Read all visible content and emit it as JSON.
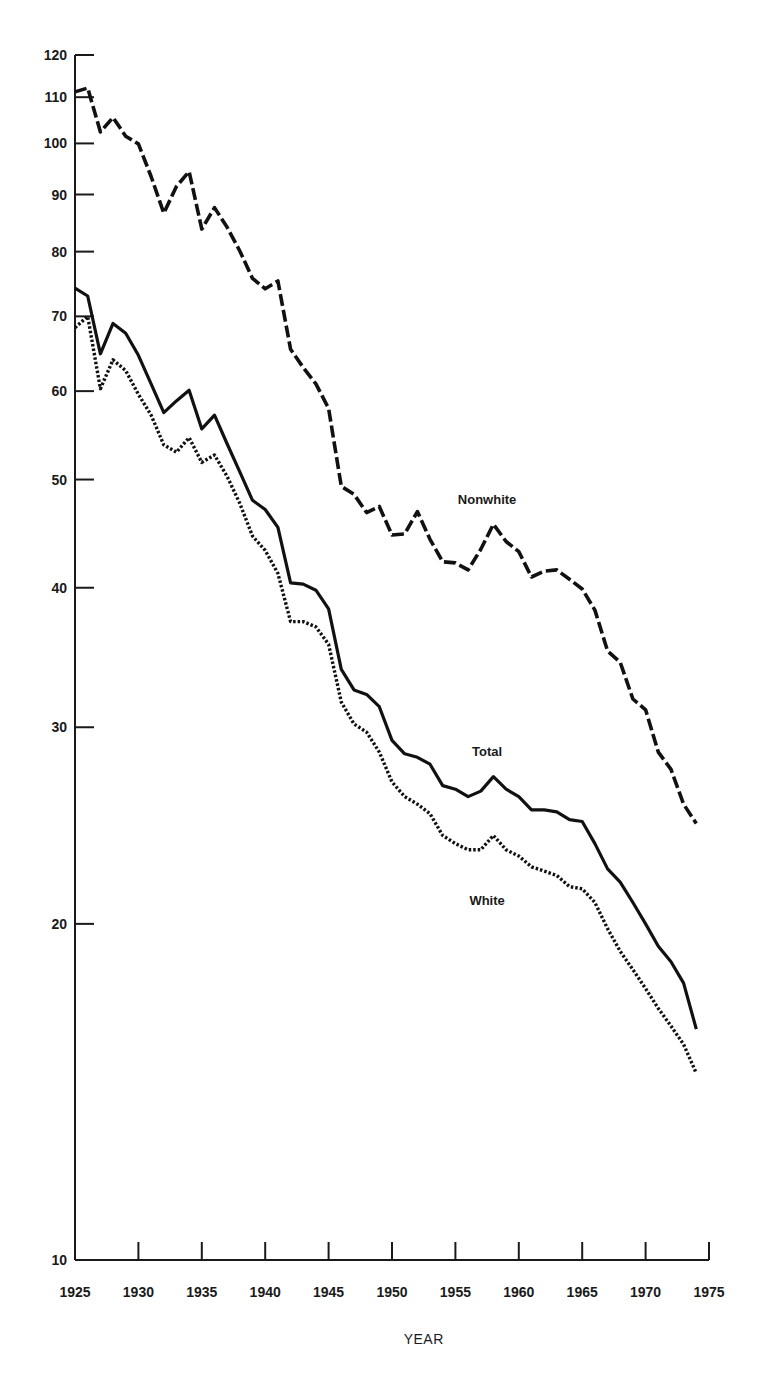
{
  "chart_data": {
    "type": "line",
    "title": "",
    "xlabel": "YEAR",
    "ylabel": "",
    "yscale": "log",
    "xlim": [
      1925,
      1975
    ],
    "ylim": [
      10,
      120
    ],
    "grid": false,
    "x_ticks": [
      "1925",
      "1930",
      "1935",
      "1940",
      "1945",
      "1950",
      "1955",
      "1960",
      "1965",
      "1970",
      "1975"
    ],
    "x_tick_values": [
      1925,
      1930,
      1935,
      1940,
      1945,
      1950,
      1955,
      1960,
      1965,
      1970,
      1975
    ],
    "y_ticks": [
      "10",
      "20",
      "30",
      "40",
      "50",
      "60",
      "70",
      "80",
      "90",
      "100",
      "110",
      "120"
    ],
    "y_tick_values": [
      10,
      20,
      30,
      40,
      50,
      60,
      70,
      80,
      90,
      100,
      110,
      120
    ],
    "x": [
      1925,
      1926,
      1927,
      1928,
      1929,
      1930,
      1931,
      1932,
      1933,
      1934,
      1935,
      1936,
      1937,
      1938,
      1939,
      1940,
      1941,
      1942,
      1943,
      1944,
      1945,
      1946,
      1947,
      1948,
      1949,
      1950,
      1951,
      1952,
      1953,
      1954,
      1955,
      1956,
      1957,
      1958,
      1959,
      1960,
      1961,
      1962,
      1963,
      1964,
      1965,
      1966,
      1967,
      1968,
      1969,
      1970,
      1971,
      1972,
      1973,
      1974
    ],
    "series": [
      {
        "name": "Nonwhite",
        "style": "dashed",
        "values": [
          111.2,
          112.1,
          102.4,
          105.5,
          101.5,
          99.9,
          93.4,
          86.6,
          91.5,
          94.4,
          83.8,
          87.6,
          84.1,
          80.1,
          75.7,
          74.1,
          75.3,
          65.4,
          63.0,
          60.9,
          57.9,
          49.3,
          48.5,
          46.7,
          47.3,
          44.6,
          44.7,
          46.8,
          44.2,
          42.2,
          42.1,
          41.5,
          43.3,
          45.6,
          44.0,
          43.1,
          40.9,
          41.4,
          41.5,
          40.7,
          39.9,
          38.2,
          35.1,
          34.3,
          31.8,
          31.1,
          28.5,
          27.5,
          25.6,
          24.6
        ]
      },
      {
        "name": "Total",
        "style": "solid",
        "values": [
          74.2,
          73.0,
          64.8,
          69.0,
          67.6,
          64.6,
          60.9,
          57.4,
          58.8,
          60.1,
          55.5,
          57.1,
          53.8,
          50.8,
          47.9,
          47.0,
          45.3,
          40.4,
          40.3,
          39.8,
          38.3,
          33.8,
          32.4,
          32.1,
          31.3,
          29.2,
          28.4,
          28.2,
          27.8,
          26.6,
          26.4,
          26.0,
          26.3,
          27.1,
          26.4,
          26.0,
          25.3,
          25.3,
          25.2,
          24.8,
          24.7,
          23.6,
          22.4,
          21.8,
          20.9,
          20.0,
          19.1,
          18.5,
          17.7,
          16.1
        ]
      },
      {
        "name": "White",
        "style": "dotted",
        "values": [
          68.4,
          70.0,
          60.3,
          64.0,
          62.6,
          59.6,
          57.1,
          53.7,
          52.9,
          54.5,
          51.8,
          52.6,
          50.3,
          47.6,
          44.5,
          43.2,
          41.2,
          37.3,
          37.3,
          36.9,
          35.6,
          31.6,
          30.2,
          29.7,
          28.5,
          26.8,
          26.0,
          25.6,
          25.1,
          24.0,
          23.6,
          23.3,
          23.3,
          24.0,
          23.3,
          23.0,
          22.5,
          22.3,
          22.1,
          21.6,
          21.5,
          20.9,
          19.8,
          18.9,
          18.2,
          17.5,
          16.8,
          16.2,
          15.6,
          14.7
        ]
      }
    ],
    "annotations": [
      {
        "text": "Nonwhite",
        "near_series": "Nonwhite",
        "x": 1957.5,
        "y": 47.5
      },
      {
        "text": "Total",
        "near_series": "Total",
        "x": 1957.5,
        "y": 28.3
      },
      {
        "text": "White",
        "near_series": "White",
        "x": 1957.5,
        "y": 20.8
      }
    ],
    "legend": "none (inline labels)"
  }
}
